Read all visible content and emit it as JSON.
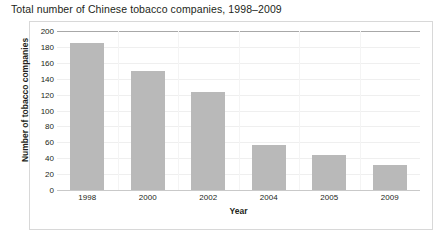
{
  "chart_data": {
    "type": "bar",
    "title": "Total number of Chinese tobacco companies, 1998–2009",
    "xlabel": "Year",
    "ylabel": "Number of tobacco companies",
    "categories": [
      "1998",
      "2000",
      "2002",
      "2004",
      "2005",
      "2009"
    ],
    "values": [
      185,
      150,
      123,
      57,
      44,
      31
    ],
    "ylim": [
      0,
      200
    ],
    "yticks": [
      0,
      20,
      40,
      60,
      80,
      100,
      120,
      140,
      160,
      180,
      200
    ],
    "ytick_labels": [
      "0",
      "20",
      "40",
      "60",
      "80",
      "100",
      "120",
      "140",
      "160",
      "180",
      "200"
    ],
    "grid": true,
    "legend": "none",
    "series": [
      {
        "name": "Number of tobacco companies",
        "values": [
          185,
          150,
          123,
          57,
          44,
          31
        ]
      }
    ],
    "colors": {
      "bar": "#b9b9b9",
      "grid": "#efefef",
      "top_rule": "#a8a8a8",
      "frame": "#d8d8d8",
      "text": "#231f20",
      "background": "#ffffff"
    }
  }
}
